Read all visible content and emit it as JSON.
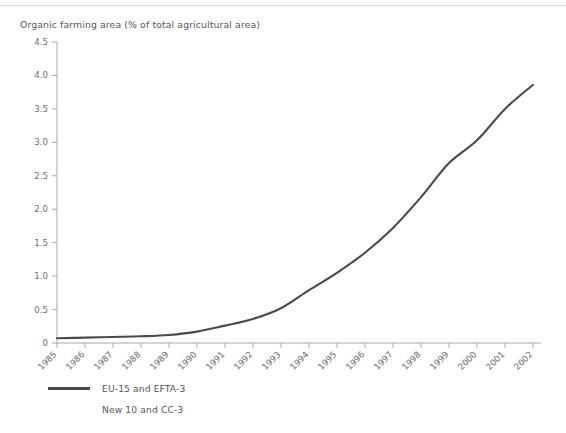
{
  "chart_data": {
    "type": "line",
    "title": "Organic farming area (% of total agricultural area)",
    "xlabel": "",
    "ylabel": "",
    "ylim": [
      0,
      4.5
    ],
    "ytick_labels": [
      "0",
      "0.5",
      "1.0",
      "1.5",
      "2.0",
      "2.5",
      "3.0",
      "3.5",
      "4.0",
      "4.5"
    ],
    "ytick_values": [
      0,
      0.5,
      1.0,
      1.5,
      2.0,
      2.5,
      3.0,
      3.5,
      4.0,
      4.5
    ],
    "grid": false,
    "legend_position": "bottom-left",
    "categories": [
      "1985",
      "1986",
      "1987",
      "1988",
      "1989",
      "1990",
      "1991",
      "1992",
      "1993",
      "1994",
      "1995",
      "1996",
      "1997",
      "1998",
      "1999",
      "2000",
      "2001",
      "2002"
    ],
    "x": [
      1985,
      1986,
      1987,
      1988,
      1989,
      1990,
      1991,
      1992,
      1993,
      1994,
      1995,
      1996,
      1997,
      1998,
      1999,
      2000,
      2001,
      2002
    ],
    "series": [
      {
        "name": "EU-15 and EFTA-3",
        "color": "#4a4a4a",
        "values": [
          0.07,
          0.08,
          0.09,
          0.1,
          0.12,
          0.17,
          0.26,
          0.36,
          0.52,
          0.79,
          1.05,
          1.35,
          1.72,
          2.18,
          2.69,
          3.03,
          3.5,
          3.86
        ]
      },
      {
        "name": "New 10 and CC-3",
        "color": "#ffffff",
        "values": [
          null,
          null,
          null,
          null,
          null,
          null,
          null,
          null,
          null,
          null,
          null,
          null,
          null,
          null,
          null,
          null,
          null,
          null
        ]
      }
    ]
  },
  "legend": {
    "items": [
      {
        "label": "EU-15 and EFTA-3"
      },
      {
        "label": "New 10 and CC-3"
      }
    ]
  },
  "axis": {
    "x_first": "1985",
    "x_last": "2002",
    "y_min_label": "0",
    "y_max_label": "4.5"
  },
  "colors": {
    "line": "#4a4a4a",
    "axis": "#a7a9ac",
    "text": "#58595b",
    "rule": "#d9dadb",
    "background": "#ffffff"
  }
}
